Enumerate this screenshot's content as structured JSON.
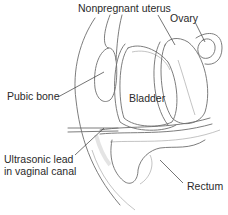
{
  "diagram": {
    "labels": {
      "uterus": "Nonpregnant uterus",
      "ovary": "Ovary",
      "pubic_bone": "Pubic bone",
      "bladder": "Bladder",
      "probe_line1": "Ultrasonic lead",
      "probe_line2": "in vaginal canal",
      "rectum": "Rectum"
    },
    "colors": {
      "line": "#6e6e6e",
      "text": "#2a2a2a",
      "shading": "#d8d8d8",
      "background": "#ffffff"
    }
  }
}
